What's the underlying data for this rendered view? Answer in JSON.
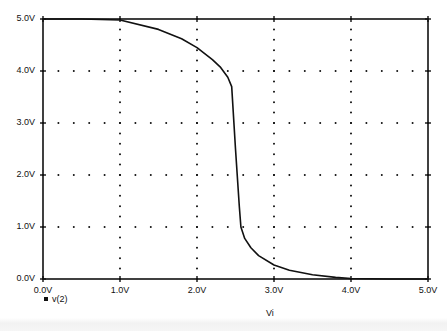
{
  "chart_data": {
    "type": "line",
    "title": "",
    "xlabel": "Vi",
    "ylabel": "",
    "xlim": [
      0,
      5
    ],
    "ylim": [
      0,
      5
    ],
    "x_ticks": [
      "0.0V",
      "1.0V",
      "2.0V",
      "3.0V",
      "4.0V",
      "5.0V"
    ],
    "y_ticks": [
      "0.0V",
      "1.0V",
      "2.0V",
      "3.0V",
      "4.0V",
      "5.0V"
    ],
    "grid": "dotted",
    "legend_position": "bottom-left",
    "series": [
      {
        "name": "v(2)",
        "x": [
          0.0,
          0.5,
          1.0,
          1.5,
          1.8,
          2.0,
          2.2,
          2.3,
          2.4,
          2.45,
          2.5,
          2.55,
          2.57,
          2.62,
          2.7,
          2.8,
          3.0,
          3.2,
          3.5,
          3.8,
          4.0,
          4.5,
          5.0
        ],
        "values": [
          5.0,
          5.0,
          4.98,
          4.8,
          4.62,
          4.45,
          4.22,
          4.08,
          3.88,
          3.7,
          2.5,
          1.4,
          1.0,
          0.78,
          0.6,
          0.45,
          0.27,
          0.17,
          0.08,
          0.03,
          0.01,
          0.0,
          0.0
        ]
      }
    ]
  },
  "legend": {
    "marker": "square-marker",
    "label": "v(2)"
  },
  "axis": {
    "x_title": "Vi"
  }
}
